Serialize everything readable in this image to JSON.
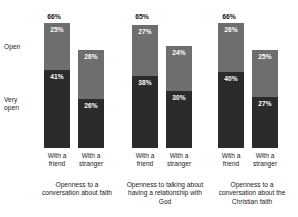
{
  "chart_data": {
    "type": "bar",
    "subtype": "stacked-bar-grouped",
    "title": "",
    "xlabel": "",
    "ylabel": "",
    "ylim": [
      0,
      70
    ],
    "grid": false,
    "legend_position": "left-axis",
    "stack_order_bottom_to_top": [
      "Very open",
      "Open"
    ],
    "series": [
      {
        "name": "Open",
        "color": "#6e6e6e"
      },
      {
        "name": "Very open",
        "color": "#2b2b2b"
      }
    ],
    "categories": [
      "With a friend",
      "With a stranger"
    ],
    "groups": [
      {
        "caption": "Openness to a conversation about faith",
        "total": "66%",
        "total_value": 66,
        "bars": [
          {
            "category": "With a friend",
            "line1": "With a",
            "line2": "friend",
            "open": 25,
            "very_open": 41,
            "open_label": "25%",
            "very_open_label": "41%"
          },
          {
            "category": "With a stranger",
            "line1": "With a",
            "line2": "stranger",
            "open": 26,
            "very_open": 26,
            "open_label": "26%",
            "very_open_label": "26%"
          }
        ]
      },
      {
        "caption": "Openness to talking about having a relationship with God",
        "total": "65%",
        "total_value": 65,
        "bars": [
          {
            "category": "With a friend",
            "line1": "With a",
            "line2": "friend",
            "open": 27,
            "very_open": 38,
            "open_label": "27%",
            "very_open_label": "38%"
          },
          {
            "category": "With a stranger",
            "line1": "With a",
            "line2": "stranger",
            "open": 24,
            "very_open": 30,
            "open_label": "24%",
            "very_open_label": "30%"
          }
        ]
      },
      {
        "caption": "Openness to a conversation about the Christian faith",
        "total": "66%",
        "total_value": 66,
        "bars": [
          {
            "category": "With a friend",
            "line1": "With a",
            "line2": "friend",
            "open": 26,
            "very_open": 40,
            "open_label": "26%",
            "very_open_label": "40%"
          },
          {
            "category": "With a stranger",
            "line1": "With a",
            "line2": "stranger",
            "open": 25,
            "very_open": 27,
            "open_label": "25%",
            "very_open_label": "27%"
          }
        ]
      }
    ],
    "axis_labels": {
      "open": "Open",
      "very_open_line1": "Very",
      "very_open_line2": "open"
    }
  }
}
